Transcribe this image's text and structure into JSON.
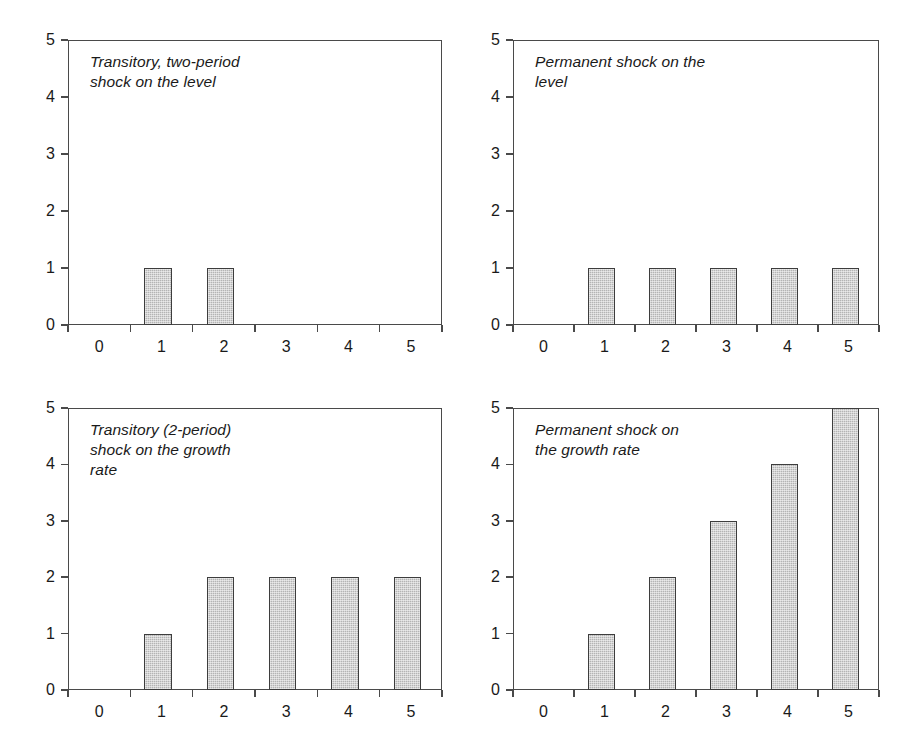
{
  "figure": {
    "background_color": "#ffffff",
    "axis_color": "#4a4a4a",
    "bar_fill_color": "#b4b4b4",
    "bar_edge_color": "#3d3d3d",
    "text_color": "#1a1a1a"
  },
  "chart_data": [
    {
      "id": "transitory-level",
      "type": "bar",
      "title": "Transitory, two-period\nshock on the level",
      "xlabel": "",
      "ylabel": "",
      "categories": [
        "0",
        "1",
        "2",
        "3",
        "4",
        "5"
      ],
      "values": [
        0,
        1,
        1,
        0,
        0,
        0
      ],
      "ylim": [
        0,
        5
      ],
      "ytick_labels": [
        "0",
        "1",
        "2",
        "3",
        "4",
        "5"
      ],
      "ytick_values": [
        0,
        1,
        2,
        3,
        4,
        5
      ],
      "xtick_labels": [
        "0",
        "1",
        "2",
        "3",
        "4",
        "5"
      ],
      "grid": false,
      "legend": "none"
    },
    {
      "id": "permanent-level",
      "type": "bar",
      "title": "Permanent shock on the\nlevel",
      "xlabel": "",
      "ylabel": "",
      "categories": [
        "0",
        "1",
        "2",
        "3",
        "4",
        "5"
      ],
      "values": [
        0,
        1,
        1,
        1,
        1,
        1
      ],
      "ylim": [
        0,
        5
      ],
      "ytick_labels": [
        "0",
        "1",
        "2",
        "3",
        "4",
        "5"
      ],
      "ytick_values": [
        0,
        1,
        2,
        3,
        4,
        5
      ],
      "xtick_labels": [
        "0",
        "1",
        "2",
        "3",
        "4",
        "5"
      ],
      "grid": false,
      "legend": "none"
    },
    {
      "id": "transitory-growth",
      "type": "bar",
      "title": "Transitory (2-period)\nshock on the growth\nrate",
      "xlabel": "",
      "ylabel": "",
      "categories": [
        "0",
        "1",
        "2",
        "3",
        "4",
        "5"
      ],
      "values": [
        0,
        1,
        2,
        2,
        2,
        2
      ],
      "ylim": [
        0,
        5
      ],
      "ytick_labels": [
        "0",
        "1",
        "2",
        "3",
        "4",
        "5"
      ],
      "ytick_values": [
        0,
        1,
        2,
        3,
        4,
        5
      ],
      "xtick_labels": [
        "0",
        "1",
        "2",
        "3",
        "4",
        "5"
      ],
      "grid": false,
      "legend": "none"
    },
    {
      "id": "permanent-growth",
      "type": "bar",
      "title": "Permanent shock on\nthe growth rate",
      "xlabel": "",
      "ylabel": "",
      "categories": [
        "0",
        "1",
        "2",
        "3",
        "4",
        "5"
      ],
      "values": [
        0,
        1,
        2,
        3,
        4,
        5
      ],
      "ylim": [
        0,
        5
      ],
      "ytick_labels": [
        "0",
        "1",
        "2",
        "3",
        "4",
        "5"
      ],
      "ytick_values": [
        0,
        1,
        2,
        3,
        4,
        5
      ],
      "xtick_labels": [
        "0",
        "1",
        "2",
        "3",
        "4",
        "5"
      ],
      "grid": false,
      "legend": "none"
    }
  ],
  "layout": {
    "panels": [
      {
        "left": 68,
        "top": 40,
        "width": 374,
        "height": 285
      },
      {
        "left": 513,
        "top": 40,
        "width": 366,
        "height": 285
      },
      {
        "left": 68,
        "top": 408,
        "width": 374,
        "height": 282
      },
      {
        "left": 513,
        "top": 408,
        "width": 366,
        "height": 282
      }
    ],
    "annotation_offsets": [
      {
        "left": 22,
        "top": 12
      },
      {
        "left": 22,
        "top": 12
      },
      {
        "left": 22,
        "top": 12
      },
      {
        "left": 22,
        "top": 12
      }
    ]
  }
}
